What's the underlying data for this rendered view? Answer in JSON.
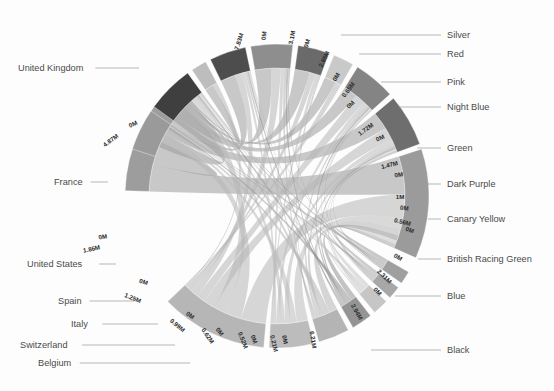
{
  "chart_data": {
    "type": "chord",
    "title": "",
    "subtitle": "",
    "xlabel": "",
    "ylabel": "",
    "grid": false,
    "legend_position": "none",
    "value_unit": "M",
    "palette": {
      "background": "#fdfdfd",
      "label_text": "#4a4a4a",
      "value_text": "#2b2b2b",
      "leader_line": "#9a9a9a",
      "arc_stroke": "#ffffff"
    },
    "left_group_name": "Country",
    "right_group_name": "Colour",
    "nodes": [
      {
        "id": "united-kingdom",
        "label": "United Kingdom",
        "side": "left",
        "value": 7.83,
        "value_label": "7.83M",
        "color": "#9d9d9d",
        "a0": 272.0,
        "a1": 318.0,
        "label_x": 18,
        "label_y": 71,
        "anchor": "start",
        "leader_to_x": 139,
        "leader_to_y": 71
      },
      {
        "id": "france",
        "label": "France",
        "side": "left",
        "value": 4.87,
        "value_label": "4.87M",
        "color": "#b6b6b6",
        "a0": 185.0,
        "a1": 226.0,
        "label_x": 54,
        "label_y": 185,
        "anchor": "start",
        "leader_to_x": 108,
        "leader_to_y": 185
      },
      {
        "id": "united-states",
        "label": "United States",
        "side": "left",
        "value": 1.86,
        "value_label": "1.86M",
        "color": "#bcbcbc",
        "a0": 166.0,
        "a1": 183.0,
        "label_x": 27,
        "label_y": 267,
        "anchor": "start",
        "leader_to_x": 116,
        "leader_to_y": 267
      },
      {
        "id": "spain",
        "label": "Spain",
        "side": "left",
        "value": 1.25,
        "value_label": "1.25M",
        "color": "#b4b4b4",
        "a0": 152.0,
        "a1": 164.0,
        "label_x": 58,
        "label_y": 304,
        "anchor": "start",
        "leader_to_x": 134,
        "leader_to_y": 304
      },
      {
        "id": "italy",
        "label": "Italy",
        "side": "left",
        "value": 0.99,
        "value_label": "0.99M",
        "color": "#949494",
        "a0": 142.0,
        "a1": 150.0,
        "label_x": 71,
        "label_y": 327,
        "anchor": "start",
        "leader_to_x": 158,
        "leader_to_y": 327
      },
      {
        "id": "switzerland",
        "label": "Switzerland",
        "side": "left",
        "value": 0.62,
        "value_label": "0.62M",
        "color": "#c6c6c6",
        "a0": 134.0,
        "a1": 140.0,
        "label_x": 20,
        "label_y": 348,
        "anchor": "start",
        "leader_to_x": 175,
        "leader_to_y": 348
      },
      {
        "id": "belgium",
        "label": "Belgium",
        "side": "left",
        "value": 0.52,
        "value_label": "0.52M",
        "color": "#a7a7a7",
        "a0": 127.0,
        "a1": 132.0,
        "label_x": 38,
        "label_y": 366,
        "anchor": "start",
        "leader_to_x": 190,
        "leader_to_y": 366
      },
      {
        "id": "other-countries",
        "label": "",
        "side": "left",
        "value": 0.21,
        "value_label": "0.21M",
        "color": "#9f9f9f",
        "a0": 120.0,
        "a1": 125.0,
        "label_x": 0,
        "label_y": 0,
        "anchor": "start",
        "leader_to_x": 0,
        "leader_to_y": 0
      },
      {
        "id": "black",
        "label": "Black",
        "side": "right",
        "value": 6.21,
        "value_label": "6.21M",
        "color": "#9b9b9b",
        "a0": 72.0,
        "a1": 114.0,
        "label_x": 447,
        "label_y": 353,
        "anchor": "start",
        "leader_to_x": 371,
        "leader_to_y": 353
      },
      {
        "id": "blue",
        "label": "Blue",
        "side": "right",
        "value": 2.94,
        "value_label": "2.94M",
        "color": "#6e6e6e",
        "a0": 50.0,
        "a1": 70.0,
        "label_x": 447,
        "label_y": 299,
        "anchor": "start",
        "leader_to_x": 395,
        "leader_to_y": 299
      },
      {
        "id": "british-racing-green",
        "label": "British Racing Green",
        "side": "right",
        "value": 2.31,
        "value_label": "2.31M",
        "color": "#848484",
        "a0": 32.0,
        "a1": 48.0,
        "label_x": 447,
        "label_y": 262,
        "anchor": "start",
        "leader_to_x": 418,
        "leader_to_y": 262
      },
      {
        "id": "canary-yellow",
        "label": "Canary Yellow",
        "side": "right",
        "value": 0.56,
        "value_label": "0.56M",
        "color": "#c9c9c9",
        "a0": 22.0,
        "a1": 30.0,
        "label_x": 447,
        "label_y": 222,
        "anchor": "start",
        "leader_to_x": 428,
        "leader_to_y": 222
      },
      {
        "id": "dark-purple",
        "label": "Dark Purple",
        "side": "right",
        "value": 1.0,
        "value_label": "1M",
        "color": "#6a6a6a",
        "a0": 8.0,
        "a1": 20.0,
        "label_x": 447,
        "label_y": 187,
        "anchor": "start",
        "leader_to_x": 427,
        "leader_to_y": 187
      },
      {
        "id": "green",
        "label": "Green",
        "side": "right",
        "value": 1.47,
        "value_label": "1.47M",
        "color": "#8e8e8e",
        "a0": 350.0,
        "a1": 6.0,
        "label_x": 447,
        "label_y": 151,
        "anchor": "start",
        "leader_to_x": 417,
        "leader_to_y": 151
      },
      {
        "id": "night-blue",
        "label": "Night Blue",
        "side": "right",
        "value": 1.72,
        "value_label": "1.72M",
        "color": "#4d4d4d",
        "a0": 334.0,
        "a1": 348.0,
        "label_x": 447,
        "label_y": 110,
        "anchor": "start",
        "leader_to_x": 399,
        "leader_to_y": 110
      },
      {
        "id": "pink",
        "label": "Pink",
        "side": "right",
        "value": 0.65,
        "value_label": "0.65M",
        "color": "#bdbdbd",
        "a0": 326.0,
        "a1": 332.0,
        "label_x": 447,
        "label_y": 85,
        "anchor": "start",
        "leader_to_x": 381,
        "leader_to_y": 85
      },
      {
        "id": "red",
        "label": "Red",
        "side": "right",
        "value": 2.65,
        "value_label": "2.65M",
        "color": "#3f3f3f",
        "a0": 306.0,
        "a1": 324.0,
        "label_x": 447,
        "label_y": 57,
        "anchor": "start",
        "leader_to_x": 359,
        "leader_to_y": 57
      },
      {
        "id": "silver",
        "label": "Silver",
        "side": "right",
        "value": 3.1,
        "value_label": "3.1M",
        "color": "#9a9a9a",
        "a0": 288.0,
        "a1": 304.0,
        "label_x": 447,
        "label_y": 38,
        "anchor": "start",
        "leader_to_x": 341,
        "leader_to_y": 38
      }
    ],
    "arc_value_labels": [
      {
        "id": "uk-start",
        "text": "7.83M",
        "x": 241,
        "y": 42,
        "rotate": -72
      },
      {
        "id": "uk-end",
        "text": "0M",
        "x": 266,
        "y": 36,
        "rotate": -83
      },
      {
        "id": "fr-start",
        "text": "4.87M",
        "x": 112,
        "y": 142,
        "rotate": -37
      },
      {
        "id": "fr-end",
        "text": "0M",
        "x": 134,
        "y": 126,
        "rotate": -26
      },
      {
        "id": "us-start",
        "text": "1.86M",
        "x": 92,
        "y": 251,
        "rotate": -12
      },
      {
        "id": "us-end",
        "text": "0M",
        "x": 103,
        "y": 239,
        "rotate": -8
      },
      {
        "id": "sp-start",
        "text": "1.25M",
        "x": 132,
        "y": 300,
        "rotate": 22
      },
      {
        "id": "sp-end",
        "text": "0M",
        "x": 143,
        "y": 284,
        "rotate": 16
      },
      {
        "id": "it-start",
        "text": "0.99M",
        "x": 176,
        "y": 327,
        "rotate": 40
      },
      {
        "id": "it-end",
        "text": "0M",
        "x": 189,
        "y": 317,
        "rotate": 36
      },
      {
        "id": "sw-start",
        "text": "0.62M",
        "x": 206,
        "y": 337,
        "rotate": 56
      },
      {
        "id": "sw-end",
        "text": "0M",
        "x": 218,
        "y": 333,
        "rotate": 54
      },
      {
        "id": "be-start",
        "text": "0.52M",
        "x": 241,
        "y": 341,
        "rotate": 68
      },
      {
        "id": "be-end",
        "text": "0M",
        "x": 252,
        "y": 340,
        "rotate": 68
      },
      {
        "id": "oc-start",
        "text": "0.21M",
        "x": 272,
        "y": 344,
        "rotate": 76
      },
      {
        "id": "oc-end",
        "text": "0M",
        "x": 283,
        "y": 340,
        "rotate": 78
      },
      {
        "id": "bk-start",
        "text": "6.21M",
        "x": 311,
        "y": 340,
        "rotate": 80
      },
      {
        "id": "bk-end",
        "text": "0M",
        "x": 376,
        "y": 293,
        "rotate": 48
      },
      {
        "id": "bl-start",
        "text": "2.94M",
        "x": 355,
        "y": 313,
        "rotate": 60
      },
      {
        "id": "bl-end",
        "text": "0M",
        "x": 397,
        "y": 259,
        "rotate": 32
      },
      {
        "id": "brg-start",
        "text": "2.31M",
        "x": 383,
        "y": 278,
        "rotate": 44
      },
      {
        "id": "brg-end",
        "text": "0M",
        "x": 409,
        "y": 232,
        "rotate": 20
      },
      {
        "id": "cy-start",
        "text": "0.56M",
        "x": 402,
        "y": 224,
        "rotate": 14
      },
      {
        "id": "cy-end",
        "text": "0M",
        "x": 404,
        "y": 210,
        "rotate": 8
      },
      {
        "id": "dp-start",
        "text": "1M",
        "x": 400,
        "y": 199,
        "rotate": 0
      },
      {
        "id": "dp-end",
        "text": "0M",
        "x": 399,
        "y": 177,
        "rotate": -8
      },
      {
        "id": "gr-start",
        "text": "1.47M",
        "x": 390,
        "y": 167,
        "rotate": -14
      },
      {
        "id": "gr-end",
        "text": "0M",
        "x": 381,
        "y": 140,
        "rotate": -24
      },
      {
        "id": "nb-start",
        "text": "1.72M",
        "x": 367,
        "y": 131,
        "rotate": -36
      },
      {
        "id": "nb-end",
        "text": "0M",
        "x": 352,
        "y": 106,
        "rotate": -46
      },
      {
        "id": "pk-start",
        "text": "0.65M",
        "x": 350,
        "y": 91,
        "rotate": -52
      },
      {
        "id": "pk-end",
        "text": "0M",
        "x": 338,
        "y": 78,
        "rotate": -58
      },
      {
        "id": "rd-start",
        "text": "2.65M",
        "x": 326,
        "y": 60,
        "rotate": -64
      },
      {
        "id": "rd-end",
        "text": "0M",
        "x": 309,
        "y": 44,
        "rotate": -74
      },
      {
        "id": "sv-start",
        "text": "3.1M",
        "x": 294,
        "y": 38,
        "rotate": -78
      }
    ],
    "flows": [
      {
        "source": "united-kingdom",
        "target": "black",
        "value": 2.1
      },
      {
        "source": "united-kingdom",
        "target": "silver",
        "value": 1.4
      },
      {
        "source": "united-kingdom",
        "target": "red",
        "value": 1.1
      },
      {
        "source": "united-kingdom",
        "target": "blue",
        "value": 0.9
      },
      {
        "source": "united-kingdom",
        "target": "night-blue",
        "value": 0.7
      },
      {
        "source": "united-kingdom",
        "target": "british-racing-green",
        "value": 0.65
      },
      {
        "source": "united-kingdom",
        "target": "green",
        "value": 0.45
      },
      {
        "source": "united-kingdom",
        "target": "dark-purple",
        "value": 0.3
      },
      {
        "source": "united-kingdom",
        "target": "pink",
        "value": 0.13
      },
      {
        "source": "united-kingdom",
        "target": "canary-yellow",
        "value": 0.1
      },
      {
        "source": "france",
        "target": "black",
        "value": 1.35
      },
      {
        "source": "france",
        "target": "silver",
        "value": 0.85
      },
      {
        "source": "france",
        "target": "red",
        "value": 0.7
      },
      {
        "source": "france",
        "target": "blue",
        "value": 0.62
      },
      {
        "source": "france",
        "target": "british-racing-green",
        "value": 0.48
      },
      {
        "source": "france",
        "target": "night-blue",
        "value": 0.36
      },
      {
        "source": "france",
        "target": "green",
        "value": 0.27
      },
      {
        "source": "france",
        "target": "dark-purple",
        "value": 0.12
      },
      {
        "source": "france",
        "target": "pink",
        "value": 0.07
      },
      {
        "source": "france",
        "target": "canary-yellow",
        "value": 0.05
      },
      {
        "source": "united-states",
        "target": "black",
        "value": 0.55
      },
      {
        "source": "united-states",
        "target": "silver",
        "value": 0.32
      },
      {
        "source": "united-states",
        "target": "blue",
        "value": 0.26
      },
      {
        "source": "united-states",
        "target": "red",
        "value": 0.24
      },
      {
        "source": "united-states",
        "target": "british-racing-green",
        "value": 0.18
      },
      {
        "source": "united-states",
        "target": "night-blue",
        "value": 0.14
      },
      {
        "source": "united-states",
        "target": "green",
        "value": 0.1
      },
      {
        "source": "united-states",
        "target": "dark-purple",
        "value": 0.07
      },
      {
        "source": "spain",
        "target": "black",
        "value": 0.38
      },
      {
        "source": "spain",
        "target": "silver",
        "value": 0.22
      },
      {
        "source": "spain",
        "target": "red",
        "value": 0.17
      },
      {
        "source": "spain",
        "target": "blue",
        "value": 0.15
      },
      {
        "source": "spain",
        "target": "british-racing-green",
        "value": 0.12
      },
      {
        "source": "spain",
        "target": "night-blue",
        "value": 0.1
      },
      {
        "source": "spain",
        "target": "green",
        "value": 0.07
      },
      {
        "source": "spain",
        "target": "dark-purple",
        "value": 0.04
      },
      {
        "source": "italy",
        "target": "black",
        "value": 0.3
      },
      {
        "source": "italy",
        "target": "silver",
        "value": 0.18
      },
      {
        "source": "italy",
        "target": "red",
        "value": 0.15
      },
      {
        "source": "italy",
        "target": "blue",
        "value": 0.12
      },
      {
        "source": "italy",
        "target": "british-racing-green",
        "value": 0.1
      },
      {
        "source": "italy",
        "target": "night-blue",
        "value": 0.08
      },
      {
        "source": "italy",
        "target": "green",
        "value": 0.06
      },
      {
        "source": "switzerland",
        "target": "black",
        "value": 0.19
      },
      {
        "source": "switzerland",
        "target": "silver",
        "value": 0.12
      },
      {
        "source": "switzerland",
        "target": "red",
        "value": 0.1
      },
      {
        "source": "switzerland",
        "target": "blue",
        "value": 0.08
      },
      {
        "source": "switzerland",
        "target": "british-racing-green",
        "value": 0.07
      },
      {
        "source": "switzerland",
        "target": "night-blue",
        "value": 0.06
      },
      {
        "source": "belgium",
        "target": "black",
        "value": 0.16
      },
      {
        "source": "belgium",
        "target": "silver",
        "value": 0.1
      },
      {
        "source": "belgium",
        "target": "red",
        "value": 0.09
      },
      {
        "source": "belgium",
        "target": "blue",
        "value": 0.07
      },
      {
        "source": "belgium",
        "target": "british-racing-green",
        "value": 0.06
      },
      {
        "source": "belgium",
        "target": "green",
        "value": 0.04
      },
      {
        "source": "other-countries",
        "target": "black",
        "value": 0.07
      },
      {
        "source": "other-countries",
        "target": "silver",
        "value": 0.05
      },
      {
        "source": "other-countries",
        "target": "red",
        "value": 0.04
      },
      {
        "source": "other-countries",
        "target": "blue",
        "value": 0.03
      },
      {
        "source": "other-countries",
        "target": "night-blue",
        "value": 0.02
      }
    ],
    "geometry": {
      "cx": 277,
      "cy": 196,
      "inner_radius": 128,
      "outer_radius": 152
    }
  }
}
